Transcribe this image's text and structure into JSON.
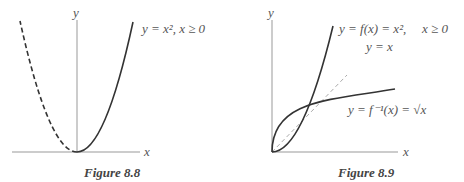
{
  "figures": [
    {
      "id": "fig-8-8",
      "caption": "Figure 8.8",
      "axis_labels": {
        "x": "x",
        "y": "y"
      },
      "curve_label": "y = x², x ≥ 0",
      "curves": [
        {
          "name": "parabola-right",
          "style": "solid",
          "function": "x^2",
          "domain": [
            0,
            1.9
          ]
        },
        {
          "name": "parabola-left",
          "style": "dashed",
          "function": "x^2",
          "domain": [
            -1.9,
            0
          ]
        }
      ]
    },
    {
      "id": "fig-8-9",
      "caption": "Figure 8.9",
      "axis_labels": {
        "x": "x",
        "y": "y"
      },
      "curve_labels": {
        "f": "y = f(x) = x²,",
        "f_domain": "x ≥ 0",
        "identity": "y = x",
        "inverse": "y = f⁻¹(x) = √x"
      },
      "curves": [
        {
          "name": "f",
          "style": "solid",
          "function": "x^2",
          "domain": [
            0,
            2.03
          ]
        },
        {
          "name": "identity",
          "style": "dashed",
          "function": "x",
          "domain": [
            0,
            2.5
          ]
        },
        {
          "name": "inverse",
          "style": "solid",
          "function": "sqrt(x)",
          "domain": [
            0,
            4.1
          ]
        }
      ]
    }
  ]
}
